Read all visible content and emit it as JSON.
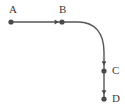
{
  "figure": {
    "type": "path-diagram",
    "background_color": "#ffffff",
    "stroke_color": "#555555",
    "node_color": "#4a4a4a",
    "label_color": "#3b3b3b",
    "stroke_width": 1.4,
    "node_radius": 2.6
  },
  "nodes": [
    {
      "id": "A",
      "label": "A",
      "x": 11,
      "y": 22,
      "label_x": 9,
      "label_y": 4
    },
    {
      "id": "B",
      "label": "B",
      "x": 62,
      "y": 22,
      "label_x": 59,
      "label_y": 4
    },
    {
      "id": "C",
      "label": "C",
      "x": 104,
      "y": 71,
      "label_x": 112,
      "label_y": 65
    },
    {
      "id": "D",
      "label": "D",
      "x": 104,
      "y": 99,
      "label_x": 112,
      "label_y": 93
    }
  ],
  "segments": [
    {
      "id": "A-B",
      "kind": "line",
      "from": "A",
      "to": "B",
      "path": "M 11 22 L 62 22",
      "arrow_at": {
        "x": 58,
        "y": 22,
        "direction": "right"
      }
    },
    {
      "id": "B-C",
      "kind": "curve",
      "from": "B",
      "to": "C",
      "path": "M 62 22 L 78 22 C 95 22 104 33 104 52 L 104 71",
      "arrow_at": {
        "x": 104,
        "y": 64,
        "direction": "down"
      }
    },
    {
      "id": "C-D",
      "kind": "line",
      "from": "C",
      "to": "D",
      "path": "M 104 71 L 104 99",
      "arrow_at": {
        "x": 104,
        "y": 93,
        "direction": "down"
      }
    }
  ]
}
